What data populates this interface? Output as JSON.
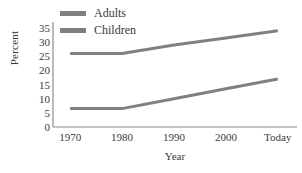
{
  "chart_data": {
    "type": "line",
    "title": "",
    "xlabel": "Year",
    "ylabel": "Percent",
    "categories": [
      "1970",
      "1980",
      "1990",
      "2000",
      "Today"
    ],
    "series": [
      {
        "name": "Adults",
        "values": [
          26,
          26,
          29,
          31.5,
          34
        ],
        "color": "#808080"
      },
      {
        "name": "Children",
        "values": [
          6.5,
          6.5,
          10,
          13.5,
          17
        ],
        "color": "#808080"
      }
    ],
    "ylim": [
      0,
      35
    ],
    "yticks": [
      "0",
      "5",
      "10",
      "15",
      "20",
      "25",
      "30",
      "35"
    ],
    "ytick_values": [
      0,
      5,
      10,
      15,
      20,
      25,
      30,
      35
    ],
    "grid": false,
    "legend_position": "top-left",
    "axis_color": "#8c8c8c",
    "line_width": 3
  },
  "legend": {
    "items": [
      {
        "label": "Adults"
      },
      {
        "label": "Children"
      }
    ]
  }
}
